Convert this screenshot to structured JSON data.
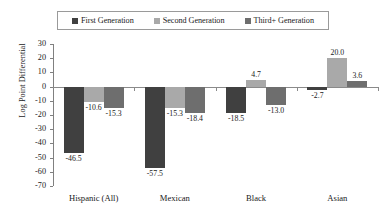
{
  "chart_data": {
    "type": "bar",
    "title": "",
    "xlabel": "",
    "ylabel": "Log Point Differential",
    "ylim": [
      -70,
      30
    ],
    "ytick_labels": [
      "30",
      "20",
      "10",
      "0",
      "-10",
      "-20",
      "-30",
      "-40",
      "-50",
      "-60",
      "-70"
    ],
    "ytick_values": [
      30,
      20,
      10,
      0,
      -10,
      -20,
      -30,
      -40,
      -50,
      -60,
      -70
    ],
    "grid": false,
    "legend_position": "top",
    "categories": [
      "Hispanic (All)",
      "Mexican",
      "Black",
      "Asian"
    ],
    "series": [
      {
        "name": "First Generation",
        "color": "#404040",
        "values": [
          -46.5,
          -57.5,
          -18.5,
          -2.7
        ],
        "labels": [
          "-46.5",
          "-57.5",
          "-18.5",
          "-2.7"
        ]
      },
      {
        "name": "Second Generation",
        "color": "#a9a9a9",
        "values": [
          -10.6,
          -15.3,
          4.7,
          20.0
        ],
        "labels": [
          "-10.6",
          "-15.3",
          "4.7",
          "20.0"
        ]
      },
      {
        "name": "Third+ Generation",
        "color": "#6e6e6e",
        "values": [
          -15.3,
          -18.4,
          -13.0,
          3.6
        ],
        "labels": [
          "-15.3",
          "-18.4",
          "-13.0",
          "3.6"
        ]
      }
    ]
  },
  "legend": {
    "items": [
      {
        "label": "First Generation",
        "color": "#404040"
      },
      {
        "label": "Second Generation",
        "color": "#a9a9a9"
      },
      {
        "label": "Third+ Generation",
        "color": "#6e6e6e"
      }
    ]
  },
  "axis": {
    "y_title": "Log Point Differential"
  }
}
